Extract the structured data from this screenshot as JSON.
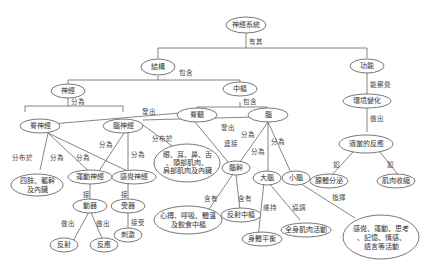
{
  "title": "神經系統",
  "nodes": {
    "root": "神經系統",
    "structure": "結構",
    "function": "功能",
    "nerves": "神經",
    "central": "中樞",
    "spinal_nerve": "脊神經",
    "cranial_nerve": "腦神經",
    "spinal_cord": "脊髓",
    "brain": "腦",
    "limbs": [
      "四肢、軀幹",
      "及內臟"
    ],
    "motor_nerve": "運動神經",
    "sensory_nerve": "感覺神經",
    "face": [
      "眼、耳、鼻、舌",
      "、頭部肌肉、",
      "肩部肌肉及內臟"
    ],
    "brainstem": "腦幹",
    "cerebrum": "大腦",
    "cerebellum": "小腦",
    "effector": "動器",
    "receptor": "受器",
    "reflex": "反射",
    "response": "反應",
    "stimulus": "刺激",
    "heart": [
      "心搏、呼吸、體溫",
      "及飲食中樞"
    ],
    "reflex_center": "反射中樞",
    "balance": "身體平衡",
    "muscle_activity": "全身肌肉活動",
    "senses": [
      "感覺、運動、思考",
      "、記憶、情感、",
      "語言等活動"
    ],
    "env_change": "環境變化",
    "proper_response": "適當的反應",
    "gland": "腺體分泌",
    "muscle": "肌肉收縮"
  },
  "edge_labels": {
    "has": "有其",
    "include1": "包含",
    "include2": "包含",
    "divide1": "分為",
    "emit1": "發出",
    "emit2": "發出",
    "connect": "連接",
    "divide_brain1": "分為",
    "divide_brain2": "分為",
    "divide_brain3": "分為",
    "dist1": "分布於",
    "divide_sp1": "分為",
    "divide_sp2": "分為",
    "divide_cr1": "分為",
    "divide_cr2": "分為",
    "dist2": "分布於",
    "connect_m": "接",
    "connect_s": "接",
    "make1": "做出",
    "make2": "做出",
    "receive": "接受",
    "contain1": "含有",
    "contain2": "含有",
    "maintain": "維持",
    "coordinate": "協調",
    "command": "指揮",
    "perceive": "能察覺",
    "make3": "做出",
    "such1": "如",
    "such2": "如"
  }
}
